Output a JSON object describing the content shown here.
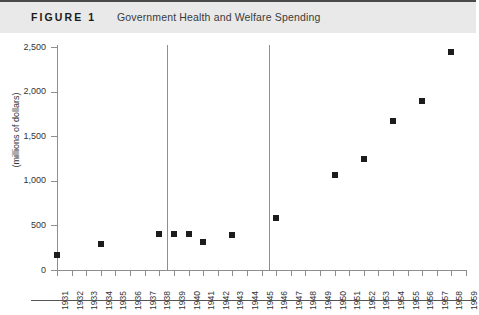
{
  "header": {
    "figure_label": "FIGURE 1",
    "title": "Government Health and Welfare Spending"
  },
  "chart_data": {
    "type": "scatter",
    "title": "Government Health and Welfare Spending",
    "xlabel": "",
    "ylabel": "(millions of dollars)",
    "ylim": [
      0,
      2500
    ],
    "ytick_labels": [
      "0",
      "500",
      "1,000",
      "1,500",
      "2,000",
      "2,500"
    ],
    "ytick_values": [
      0,
      500,
      1000,
      1500,
      2000,
      2500
    ],
    "xlim": [
      1931,
      1959
    ],
    "grid": false,
    "legend": "none",
    "categories": [
      "1931",
      "1932",
      "1933",
      "1934",
      "1935",
      "1936",
      "1937",
      "1938",
      "1939",
      "1940",
      "1941",
      "1942",
      "1943",
      "1944",
      "1945",
      "1946",
      "1947",
      "1948",
      "1949",
      "1950",
      "1951",
      "1952",
      "1953",
      "1954",
      "1955",
      "1956",
      "1957",
      "1958",
      "1959"
    ],
    "points": [
      {
        "x": 1931,
        "y": 170
      },
      {
        "x": 1934,
        "y": 290
      },
      {
        "x": 1938,
        "y": 400
      },
      {
        "x": 1939,
        "y": 400
      },
      {
        "x": 1940,
        "y": 400
      },
      {
        "x": 1941,
        "y": 320
      },
      {
        "x": 1943,
        "y": 390
      },
      {
        "x": 1946,
        "y": 580
      },
      {
        "x": 1950,
        "y": 1070
      },
      {
        "x": 1952,
        "y": 1250
      },
      {
        "x": 1954,
        "y": 1670
      },
      {
        "x": 1956,
        "y": 1890
      },
      {
        "x": 1958,
        "y": 2440
      }
    ],
    "reference_lines": [
      {
        "x": 1939,
        "orientation": "vertical"
      },
      {
        "x": 1946,
        "orientation": "vertical"
      }
    ],
    "marker_color": "#1c1c1c",
    "axis_color": "#8e8e8e",
    "header_background": "#e9e9e9",
    "rule_color": "#4a4a4a"
  }
}
